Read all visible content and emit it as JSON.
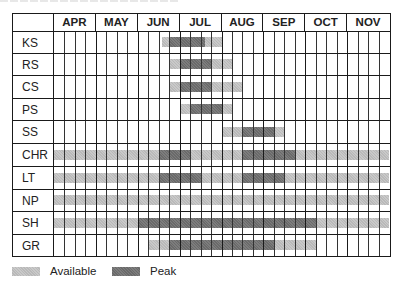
{
  "chart_data": {
    "type": "table",
    "title": "",
    "months": [
      "APR",
      "MAY",
      "JUN",
      "JUL",
      "AUG",
      "SEP",
      "OCT",
      "NOV"
    ],
    "weeks_per_month": 4,
    "legend": [
      {
        "name": "Available",
        "color": "#c0c0c0"
      },
      {
        "name": "Peak",
        "color": "#737373"
      }
    ],
    "rows": [
      {
        "label": "KS",
        "available": [
          [
            10.3,
            16
          ]
        ],
        "peak": [
          [
            11,
            14.4
          ]
        ]
      },
      {
        "label": "RS",
        "available": [
          [
            11,
            17
          ]
        ],
        "peak": [
          [
            12,
            15
          ]
        ]
      },
      {
        "label": "CS",
        "available": [
          [
            11,
            18
          ]
        ],
        "peak": [
          [
            12,
            15
          ]
        ]
      },
      {
        "label": "PS",
        "available": [
          [
            12,
            17
          ]
        ],
        "peak": [
          [
            13,
            16
          ]
        ]
      },
      {
        "label": "SS",
        "available": [
          [
            16,
            22
          ]
        ],
        "peak": [
          [
            18,
            21
          ]
        ]
      },
      {
        "label": "CHR",
        "available": [
          [
            0,
            32
          ]
        ],
        "peak": [
          [
            10,
            13
          ],
          [
            18,
            23
          ]
        ]
      },
      {
        "label": "LT",
        "available": [
          [
            0,
            32
          ]
        ],
        "peak": [
          [
            10,
            14
          ],
          [
            18,
            22
          ]
        ]
      },
      {
        "label": "NP",
        "available": [
          [
            0,
            32
          ]
        ],
        "peak": []
      },
      {
        "label": "SH",
        "available": [
          [
            0,
            32
          ]
        ],
        "peak": [
          [
            8,
            25
          ]
        ]
      },
      {
        "label": "GR",
        "available": [
          [
            9,
            25
          ]
        ],
        "peak": [
          [
            11,
            21
          ]
        ]
      }
    ]
  },
  "legend": {
    "available_label": "Available",
    "peak_label": "Peak"
  }
}
